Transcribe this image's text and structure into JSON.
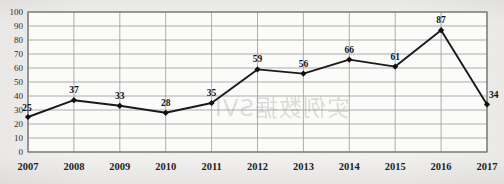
{
  "chart_data": {
    "type": "line",
    "title": "",
    "subtitle": "",
    "xlabel": "",
    "ylabel": "",
    "categories": [
      "2007",
      "2008",
      "2009",
      "2010",
      "2011",
      "2012",
      "2013",
      "2014",
      "2015",
      "2016",
      "2017"
    ],
    "values": [
      25,
      37,
      33,
      28,
      35,
      59,
      56,
      66,
      61,
      87,
      34
    ],
    "data_labels": [
      "25",
      "37",
      "33",
      "28",
      "35",
      "59",
      "56",
      "66",
      "61",
      "87",
      "34"
    ],
    "ylim": [
      0,
      100
    ],
    "ytick_step": 10,
    "ytick_labels": [
      "0",
      "10",
      "20",
      "30",
      "40",
      "50",
      "60",
      "70",
      "80",
      "90",
      "100"
    ],
    "grid": {
      "horizontal": true,
      "vertical": true
    },
    "legend": {
      "visible": false,
      "position": "none"
    },
    "series": [
      {
        "name": "",
        "values": [
          25,
          37,
          33,
          28,
          35,
          59,
          56,
          66,
          61,
          87,
          34
        ],
        "marker": "diamond",
        "line_color": "#1a1a1a",
        "marker_color": "#111111"
      }
    ],
    "annotations": []
  },
  "style": {
    "page_background": "#f3f2f0",
    "plot_background": "#fbfbfa",
    "grid_color": "#9a9a9a",
    "axis_color": "#6f6f6f",
    "text_color": "#1e1e1e"
  },
  "watermark": {
    "text_cjk": "实例数据SVI",
    "text_latin": "IVS",
    "visible": true
  }
}
